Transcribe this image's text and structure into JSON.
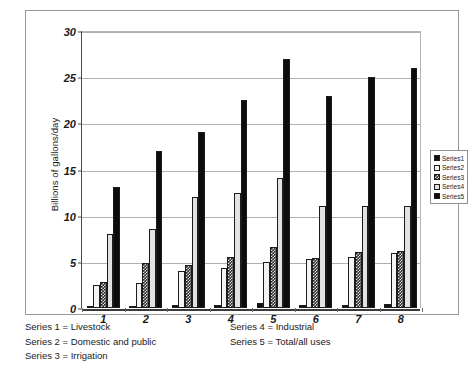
{
  "chart_data": {
    "type": "bar",
    "title": "",
    "xlabel": "",
    "ylabel": "Billions of gallons/day",
    "ylim": [
      0,
      30
    ],
    "yticks": [
      0,
      5,
      10,
      15,
      20,
      25,
      30
    ],
    "categories": [
      "1",
      "2",
      "3",
      "4",
      "5",
      "6",
      "7",
      "8"
    ],
    "grid": true,
    "legend_position": "right",
    "series": [
      {
        "name": "Series1",
        "label": "Livestock",
        "values": [
          0.2,
          0.25,
          0.3,
          0.35,
          0.5,
          0.3,
          0.3,
          0.4
        ]
      },
      {
        "name": "Series2",
        "label": "Domestic and public",
        "values": [
          2.5,
          2.7,
          4.0,
          4.3,
          5.0,
          5.3,
          5.5,
          6.0
        ]
      },
      {
        "name": "Series3",
        "label": "Irrigation",
        "values": [
          2.8,
          4.9,
          4.7,
          5.5,
          6.6,
          5.4,
          6.1,
          6.2
        ]
      },
      {
        "name": "Series4",
        "label": "Industrial",
        "values": [
          8.0,
          8.6,
          12.0,
          12.5,
          14.1,
          11.0,
          11.0,
          11.0
        ]
      },
      {
        "name": "Series5",
        "label": "Total/all uses",
        "values": [
          13.1,
          17.0,
          19.1,
          22.5,
          27.0,
          23.0,
          25.0,
          26.0
        ]
      }
    ]
  },
  "legend": {
    "entries": [
      {
        "label": "Series1"
      },
      {
        "label": "Series2"
      },
      {
        "label": "Series3"
      },
      {
        "label": "Series4"
      },
      {
        "label": "Series5"
      }
    ]
  },
  "caption": {
    "left": [
      "Series 1  =  Livestock",
      "Series 2  =  Domestic and public",
      "Series 3  =  Irrigation"
    ],
    "right": [
      "Series 4  =  Industrial",
      "Series 5  =  Total/all uses"
    ]
  },
  "colors": {
    "series1": "#111111",
    "series2": "#f4f4f4",
    "series3": "#2a2a2a",
    "series4": "#e2e2e2",
    "series5": "#0c0c0c",
    "frame": "#9a9a9a",
    "gridline": "#b0b0b0",
    "axis": "#3a3a3a"
  }
}
